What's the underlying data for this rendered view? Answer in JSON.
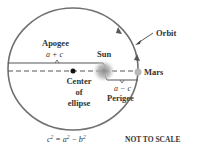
{
  "diagram": {
    "labels": {
      "apogee": "Apogee",
      "apogee_formula": "a + c",
      "sun": "Sun",
      "mars": "Mars",
      "orbit": "Orbit",
      "center_line1": "Center",
      "center_line2": "of",
      "center_line3": "ellipse",
      "perigee_formula": "a − c",
      "perigee": "Perigee",
      "equation_c": "c",
      "equation_eq": " = a",
      "equation_minus": " − b",
      "exp": "2",
      "note": "NOT TO SCALE"
    },
    "colors": {
      "orbit": "#707070",
      "text": "#333333",
      "sun": "#a0a0a0",
      "mars": "#b8b8b8",
      "center_dot": "#111111"
    }
  }
}
